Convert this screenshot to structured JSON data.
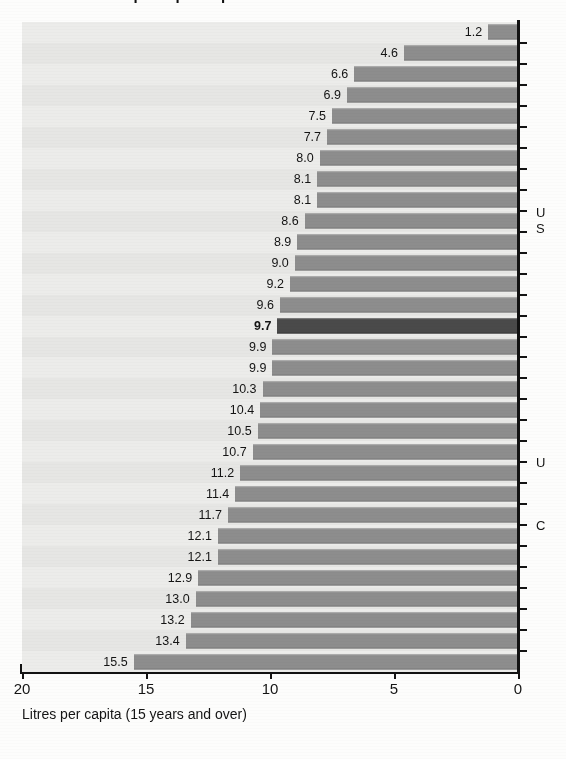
{
  "title": {
    "clipped_text": "Alcohol consumption per capita"
  },
  "axis": {
    "caption": "Litres per capita (15 years and over)",
    "ticks": [
      "20",
      "15",
      "10",
      "5",
      "0"
    ],
    "tick_values": [
      20,
      15,
      10,
      5,
      0
    ],
    "min": 0,
    "max": 20,
    "reversed": true
  },
  "right_labels": [
    {
      "text": "U",
      "top": 205
    },
    {
      "text": "S",
      "top": 221
    },
    {
      "text": "U",
      "top": 455
    },
    {
      "text": "C",
      "top": 518
    }
  ],
  "colors": {
    "bar": "#8d8d8d",
    "bar_highlight": "#4a4a4a",
    "band": "#ececea",
    "band_alt": "#e6e6e4",
    "axis": "#121212",
    "text": "#141414",
    "page": "#fdfdfc"
  },
  "chart_data": {
    "type": "bar",
    "orientation": "horizontal",
    "title": "Alcohol consumption per capita",
    "xlabel": "Litres per capita (15 years and over)",
    "ylabel": "",
    "xlim": [
      20,
      0
    ],
    "grid": false,
    "legend": "none",
    "value_format": "one-decimal",
    "highlight_value": 9.7,
    "categories": [
      "bar-01",
      "bar-02",
      "bar-03",
      "bar-04",
      "bar-05",
      "bar-06",
      "bar-07",
      "bar-08",
      "bar-09",
      "bar-10",
      "bar-11",
      "bar-12",
      "bar-13",
      "bar-14",
      "bar-15",
      "bar-16",
      "bar-17",
      "bar-18",
      "bar-19",
      "bar-20",
      "bar-21",
      "bar-22",
      "bar-23",
      "bar-24",
      "bar-25",
      "bar-26",
      "bar-27",
      "bar-28",
      "bar-29",
      "bar-30"
    ],
    "values": [
      1.2,
      4.6,
      6.6,
      6.9,
      7.5,
      7.7,
      8.0,
      8.1,
      8.1,
      8.6,
      8.9,
      9.0,
      9.2,
      9.6,
      9.7,
      9.9,
      9.9,
      10.3,
      10.4,
      10.5,
      10.7,
      11.2,
      11.4,
      11.7,
      12.1,
      12.1,
      12.9,
      13.0,
      13.2,
      13.4
    ],
    "labels": [
      "1.2",
      "4.6",
      "6.6",
      "6.9",
      "7.5",
      "7.7",
      "8.0",
      "8.1",
      "8.1",
      "8.6",
      "8.9",
      "9.0",
      "9.2",
      "9.6",
      "9.7",
      "9.9",
      "9.9",
      "10.3",
      "10.4",
      "10.5",
      "10.7",
      "11.2",
      "11.4",
      "11.7",
      "12.1",
      "12.1",
      "12.9",
      "13.0",
      "13.2",
      "13.4"
    ],
    "highlighted": [
      false,
      false,
      false,
      false,
      false,
      false,
      false,
      false,
      false,
      false,
      false,
      false,
      false,
      false,
      true,
      false,
      false,
      false,
      false,
      false,
      false,
      false,
      false,
      false,
      false,
      false,
      false,
      false,
      false,
      false
    ],
    "last_row": {
      "label": "15.5",
      "value": 15.5,
      "highlighted": false
    }
  }
}
